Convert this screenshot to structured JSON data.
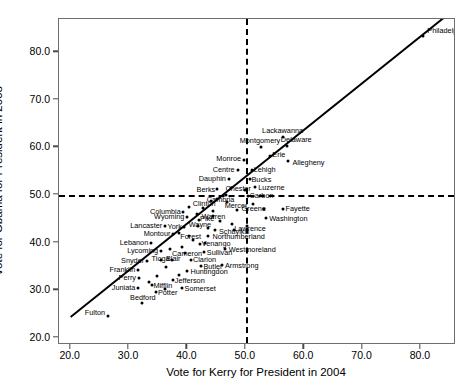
{
  "chart_data": {
    "type": "scatter",
    "title": "",
    "xlabel": "Vote for Kerry for President in 2004",
    "ylabel": "Vote for Obama for President in 2008",
    "xlim": [
      18.0,
      86.0
    ],
    "ylim": [
      18.5,
      87.0
    ],
    "xticks": [
      "20.0",
      "30.0",
      "40.0",
      "50.0",
      "60.0",
      "70.0",
      "80.0"
    ],
    "xtick_values": [
      20,
      30,
      40,
      50,
      60,
      70,
      80
    ],
    "yticks": [
      "20.0",
      "30.0",
      "40.0",
      "50.0",
      "60.0",
      "70.0",
      "80.0"
    ],
    "ytick_values": [
      20,
      30,
      40,
      50,
      60,
      70,
      80
    ],
    "grid": false,
    "legend": null,
    "reference_lines": [
      {
        "name": "horizontal-50",
        "orientation": "horizontal",
        "value": 50,
        "style": "dashed"
      },
      {
        "name": "vertical-50",
        "orientation": "vertical",
        "value": 50,
        "style": "dashed"
      },
      {
        "name": "identity-line",
        "orientation": "diagonal",
        "style": "solid",
        "from": [
          20.0,
          24.0
        ],
        "to": [
          85.0,
          88.0
        ]
      }
    ],
    "point_color": "#000000",
    "line_color": "#000000",
    "points": [
      {
        "label": "Philadelphia",
        "x": 80.4,
        "y": 83.4,
        "lpos": "right",
        "ldx": 4,
        "ldy": -5
      },
      {
        "label": "Lackawanna",
        "x": 56.3,
        "y": 62.3,
        "lpos": "center",
        "ldx": 0,
        "ldy": -6
      },
      {
        "label": "Montgomery",
        "x": 52.6,
        "y": 60.2,
        "lpos": "center",
        "ldx": -1,
        "ldy": -6
      },
      {
        "label": "Delaware",
        "x": 57.1,
        "y": 60.3,
        "lpos": "center",
        "ldx": 9,
        "ldy": -6
      },
      {
        "label": "Monroe",
        "x": 49.7,
        "y": 57.3,
        "lpos": "left",
        "ldx": -3,
        "ldy": -1
      },
      {
        "label": "Erie",
        "x": 54.2,
        "y": 58.2,
        "lpos": "right",
        "ldx": 2,
        "ldy": -1
      },
      {
        "label": "Allegheny",
        "x": 57.3,
        "y": 57.2,
        "lpos": "right",
        "ldx": 4,
        "ldy": 2
      },
      {
        "label": "Centre",
        "x": 48.6,
        "y": 55.2,
        "lpos": "left",
        "ldx": -3,
        "ldy": 0
      },
      {
        "label": "Lehigh",
        "x": 51.0,
        "y": 55.3,
        "lpos": "right",
        "ldx": 2,
        "ldy": 0
      },
      {
        "label": "Dauphin",
        "x": 47.1,
        "y": 53.4,
        "lpos": "left",
        "ldx": -3,
        "ldy": 0
      },
      {
        "label": "Bucks",
        "x": 50.8,
        "y": 53.4,
        "lpos": "right",
        "ldx": 1,
        "ldy": 1
      },
      {
        "label": "Berks",
        "x": 45.1,
        "y": 51.3,
        "lpos": "left",
        "ldx": -2,
        "ldy": 1
      },
      {
        "label": "Chester",
        "x": 47.5,
        "y": 51.5,
        "lpos": "center",
        "ldx": 7,
        "ldy": 1
      },
      {
        "label": "Luzerne",
        "x": 51.6,
        "y": 51.6,
        "lpos": "right",
        "ldx": 3,
        "ldy": 1
      },
      {
        "label": "Cambria",
        "x": 45.0,
        "y": 49.2,
        "lpos": "center",
        "ldx": 4,
        "ldy": 1
      },
      {
        "label": "Carbon",
        "x": 50.3,
        "y": 49.8,
        "lpos": "right",
        "ldx": 2,
        "ldy": 0
      },
      {
        "label": "Columbia",
        "x": 39.2,
        "y": 46.5,
        "lpos": "left",
        "ldx": -2,
        "ldy": 0
      },
      {
        "label": "Clinton",
        "x": 42.7,
        "y": 47.3,
        "lpos": "center",
        "ldx": 1,
        "ldy": -4
      },
      {
        "label": "Mercer",
        "x": 48.5,
        "y": 46.8,
        "lpos": "center",
        "ldx": -1,
        "ldy": -4
      },
      {
        "label": "Greene",
        "x": 53.1,
        "y": 47.0,
        "lpos": "left",
        "ldx": 2,
        "ldy": 0
      },
      {
        "label": "Fayette",
        "x": 56.3,
        "y": 47.0,
        "lpos": "right",
        "ldx": 3,
        "ldy": 0
      },
      {
        "label": "Wyoming",
        "x": 40.0,
        "y": 45.3,
        "lpos": "left",
        "ldx": -3,
        "ldy": 0
      },
      {
        "label": "Warren",
        "x": 44.3,
        "y": 45.6,
        "lpos": "center",
        "ldx": 1,
        "ldy": 1
      },
      {
        "label": "Washington",
        "x": 53.5,
        "y": 45.2,
        "lpos": "right",
        "ldx": 3,
        "ldy": 1
      },
      {
        "label": "Pike",
        "x": 42.0,
        "y": 44.7,
        "lpos": "right",
        "ldx": 1,
        "ldy": -1
      },
      {
        "label": "Lancaster",
        "x": 36.2,
        "y": 43.4,
        "lpos": "left",
        "ldx": -3,
        "ldy": 0
      },
      {
        "label": "York",
        "x": 39.4,
        "y": 43.2,
        "lpos": "left",
        "ldx": -2,
        "ldy": 0
      },
      {
        "label": "Wayne",
        "x": 41.8,
        "y": 43.4,
        "lpos": "center",
        "ldx": 2,
        "ldy": -1
      },
      {
        "label": "Schuylkill",
        "x": 44.7,
        "y": 42.6,
        "lpos": "right",
        "ldx": 4,
        "ldy": 2
      },
      {
        "label": "Lawrence",
        "x": 50.2,
        "y": 43.6,
        "lpos": "center",
        "ldx": 3,
        "ldy": 3
      },
      {
        "label": "Montour",
        "x": 37.6,
        "y": 41.8,
        "lpos": "left",
        "ldx": -3,
        "ldy": 0
      },
      {
        "label": "Forest",
        "x": 40.2,
        "y": 41.3,
        "lpos": "center",
        "ldx": 2,
        "ldy": 1
      },
      {
        "label": "Northumberland",
        "x": 43.6,
        "y": 41.4,
        "lpos": "right",
        "ldx": 4,
        "ldy": 1
      },
      {
        "label": "Lebanon",
        "x": 33.8,
        "y": 39.9,
        "lpos": "left",
        "ldx": -3,
        "ldy": 0
      },
      {
        "label": "Venango",
        "x": 42.1,
        "y": 39.8,
        "lpos": "right",
        "ldx": 2,
        "ldy": 0
      },
      {
        "label": "Westmoreland",
        "x": 46.4,
        "y": 38.6,
        "lpos": "right",
        "ldx": 4,
        "ldy": 1
      },
      {
        "label": "Lycoming",
        "x": 35.5,
        "y": 38.2,
        "lpos": "left",
        "ldx": -3,
        "ldy": 0
      },
      {
        "label": "Cameron",
        "x": 39.6,
        "y": 37.9,
        "lpos": "center",
        "ldx": 2,
        "ldy": 1
      },
      {
        "label": "Sullivan",
        "x": 42.8,
        "y": 38.0,
        "lpos": "right",
        "ldx": 3,
        "ldy": 1
      },
      {
        "label": "Snyder",
        "x": 33.1,
        "y": 36.1,
        "lpos": "left",
        "ldx": -3,
        "ldy": 0
      },
      {
        "label": "Tioga",
        "x": 35.4,
        "y": 36.4,
        "lpos": "center",
        "ldx": 0,
        "ldy": -1
      },
      {
        "label": "Blair",
        "x": 37.4,
        "y": 36.3,
        "lpos": "center",
        "ldx": 1,
        "ldy": -1
      },
      {
        "label": "Clarion",
        "x": 40.6,
        "y": 36.3,
        "lpos": "right",
        "ldx": 2,
        "ldy": 0
      },
      {
        "label": "Butler",
        "x": 42.4,
        "y": 35.1,
        "lpos": "right",
        "ldx": 2,
        "ldy": 1
      },
      {
        "label": "Armstrong",
        "x": 45.9,
        "y": 35.4,
        "lpos": "right",
        "ldx": 3,
        "ldy": 1
      },
      {
        "label": "Franklin",
        "x": 31.6,
        "y": 34.3,
        "lpos": "left",
        "ldx": -3,
        "ldy": 0
      },
      {
        "label": "Huntingdon",
        "x": 40.0,
        "y": 34.0,
        "lpos": "right",
        "ldx": 3,
        "ldy": 1
      },
      {
        "label": "Perry",
        "x": 31.7,
        "y": 32.5,
        "lpos": "left",
        "ldx": -3,
        "ldy": 0
      },
      {
        "label": "Jefferson",
        "x": 37.5,
        "y": 32.2,
        "lpos": "right",
        "ldx": 2,
        "ldy": 1
      },
      {
        "label": "Juniata",
        "x": 31.6,
        "y": 30.4,
        "lpos": "left",
        "ldx": -3,
        "ldy": 0
      },
      {
        "label": "Mifflin",
        "x": 34.0,
        "y": 31.1,
        "lpos": "right",
        "ldx": 1,
        "ldy": 1
      },
      {
        "label": "Potter",
        "x": 34.6,
        "y": 29.6,
        "lpos": "right",
        "ldx": 2,
        "ldy": 1
      },
      {
        "label": "Somerset",
        "x": 39.0,
        "y": 30.4,
        "lpos": "right",
        "ldx": 3,
        "ldy": 1
      },
      {
        "label": "Bedford",
        "x": 32.2,
        "y": 27.4,
        "lpos": "center",
        "ldx": 1,
        "ldy": -5
      },
      {
        "label": "Fulton",
        "x": 26.4,
        "y": 24.5,
        "lpos": "left",
        "ldx": -3,
        "ldy": -3
      }
    ],
    "extra_points": [
      {
        "x": 49.8,
        "y": 51.0
      },
      {
        "x": 46.6,
        "y": 50.1
      },
      {
        "x": 44.0,
        "y": 48.8
      },
      {
        "x": 46.8,
        "y": 48.6
      },
      {
        "x": 51.2,
        "y": 48.1
      },
      {
        "x": 44.4,
        "y": 46.6
      },
      {
        "x": 41.6,
        "y": 46.0
      },
      {
        "x": 45.6,
        "y": 44.6
      },
      {
        "x": 47.6,
        "y": 44.0
      },
      {
        "x": 38.6,
        "y": 42.0
      },
      {
        "x": 41.0,
        "y": 40.6
      },
      {
        "x": 43.0,
        "y": 40.0
      },
      {
        "x": 39.0,
        "y": 39.0
      },
      {
        "x": 37.0,
        "y": 38.6
      },
      {
        "x": 36.4,
        "y": 34.8
      },
      {
        "x": 38.6,
        "y": 33.2
      },
      {
        "x": 34.8,
        "y": 33.0
      },
      {
        "x": 33.4,
        "y": 31.8
      },
      {
        "x": 36.2,
        "y": 30.2
      },
      {
        "x": 40.2,
        "y": 47.4
      },
      {
        "x": 43.6,
        "y": 43.0
      },
      {
        "x": 48.0,
        "y": 42.6
      }
    ]
  }
}
